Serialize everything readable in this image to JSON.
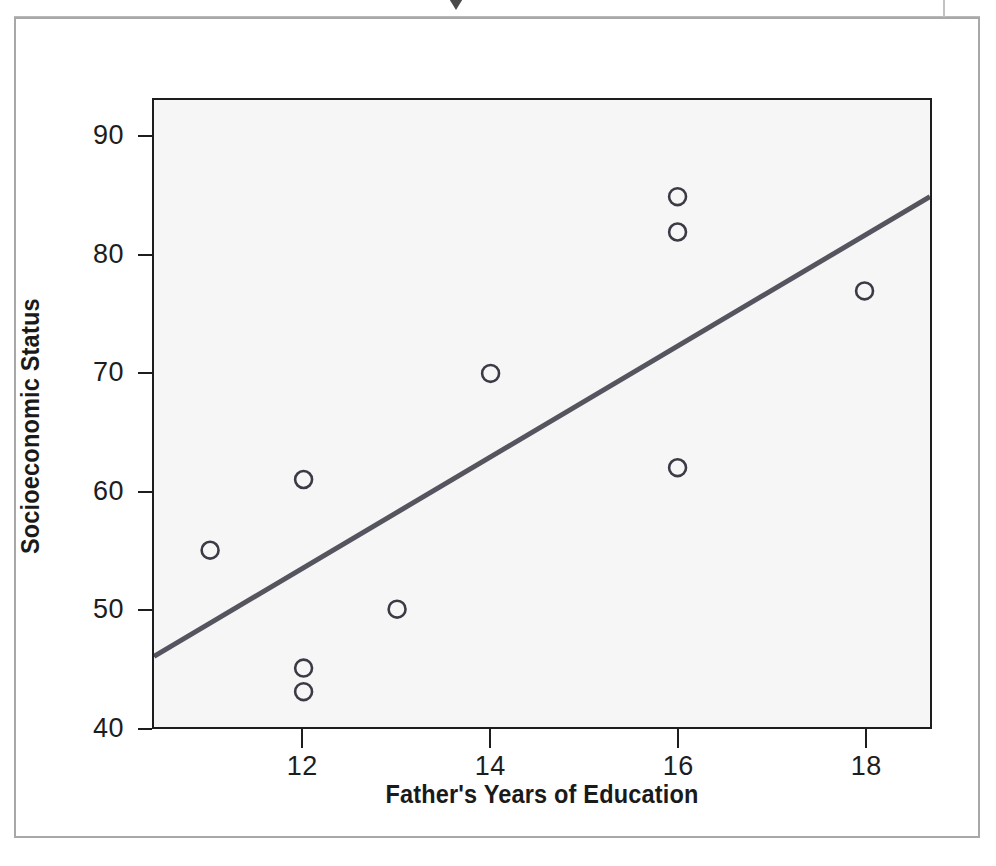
{
  "figure": {
    "background_color": "#ffffff",
    "frame_color": "#a8a8a8",
    "plot_background_color": "#f6f6f6",
    "plot_frame_color": "#1d1d1d"
  },
  "chart_data": {
    "type": "scatter",
    "title": "",
    "xlabel": "Father's Years of Education",
    "ylabel": "Socioeconomic Status",
    "xlim": [
      10.4,
      18.7
    ],
    "ylim": [
      40,
      93.2
    ],
    "xticks": [
      12,
      14,
      16,
      18
    ],
    "xtick_labels": [
      "12",
      "14",
      "16",
      "18"
    ],
    "yticks": [
      40,
      50,
      60,
      70,
      80,
      90
    ],
    "ytick_labels": [
      "40",
      "50",
      "60",
      "70",
      "80",
      "90"
    ],
    "grid": false,
    "legend": false,
    "marker": "open-circle",
    "marker_color": "#3b3b46",
    "marker_size": 17,
    "points": [
      {
        "x": 11,
        "y": 55
      },
      {
        "x": 12,
        "y": 61
      },
      {
        "x": 12,
        "y": 45
      },
      {
        "x": 12,
        "y": 43
      },
      {
        "x": 13,
        "y": 50
      },
      {
        "x": 14,
        "y": 70
      },
      {
        "x": 16,
        "y": 85
      },
      {
        "x": 16,
        "y": 82
      },
      {
        "x": 16,
        "y": 62
      },
      {
        "x": 18,
        "y": 77
      }
    ],
    "trendline": {
      "type": "linear-fit",
      "color": "#55555f",
      "width": 5,
      "x_start": 10.4,
      "y_start": 46,
      "x_end": 18.7,
      "y_end": 85
    }
  },
  "icons": {
    "caret": "caret-down-icon"
  }
}
